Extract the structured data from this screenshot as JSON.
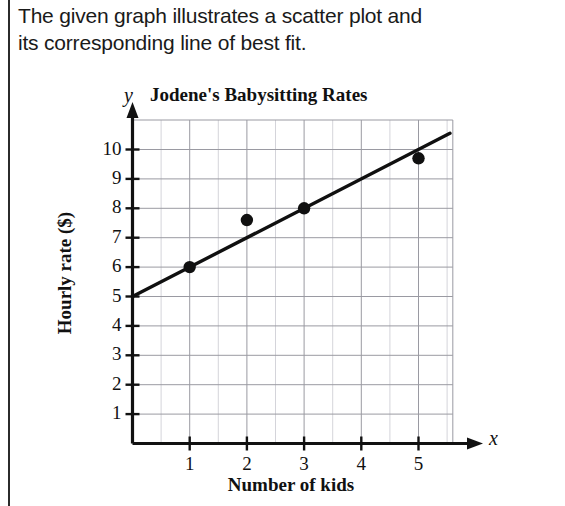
{
  "prompt": {
    "line1": "The given graph illustrates a scatter plot and",
    "line2": "its corresponding line of best fit."
  },
  "colors": {
    "ink": "#1a1a1a",
    "grid_major": "#9a9aa2",
    "grid_minor": "#c9c9d0",
    "axis": "#111111",
    "marker": "#101010",
    "rule": "#2b2b2b"
  },
  "chart_data": {
    "type": "scatter",
    "title": "Jodene's Babysitting Rates",
    "xlabel": "Number of kids",
    "ylabel": "Hourly rate ($)",
    "x_axis_letter": "x",
    "y_axis_letter": "y",
    "xlim": [
      0,
      5.6
    ],
    "ylim": [
      0,
      10.8
    ],
    "xticks": [
      1,
      2,
      3,
      4,
      5
    ],
    "xtick_labels": [
      "1",
      "2",
      "3",
      "4",
      "5"
    ],
    "yticks": [
      1,
      2,
      3,
      4,
      5,
      6,
      7,
      8,
      9,
      10
    ],
    "ytick_labels": [
      "1",
      "2",
      "3",
      "4",
      "5",
      "6",
      "7",
      "8",
      "9",
      "10"
    ],
    "grid": true,
    "grid_minor_x_step": 0.5,
    "legend": null,
    "series": [
      {
        "name": "Babysitting rate data points",
        "type": "scatter",
        "points": [
          {
            "x": 1,
            "y": 6.0
          },
          {
            "x": 2,
            "y": 7.6
          },
          {
            "x": 3,
            "y": 8.0
          },
          {
            "x": 5,
            "y": 9.7
          }
        ]
      },
      {
        "name": "Line of best fit",
        "type": "line",
        "from": {
          "x": 0,
          "y": 5.0
        },
        "to": {
          "x": 5.55,
          "y": 10.55
        },
        "slope": 1.0,
        "intercept": 5.0
      }
    ]
  }
}
